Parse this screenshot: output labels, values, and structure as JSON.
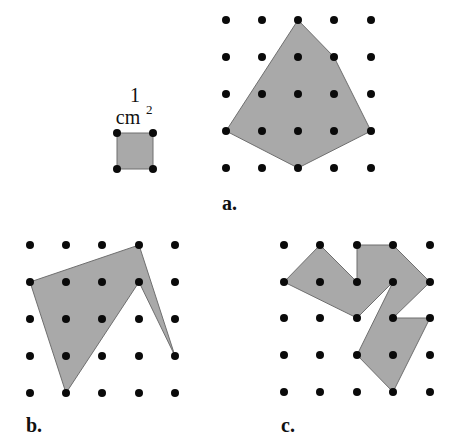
{
  "figure": {
    "colors": {
      "dot": "#0a0a0a",
      "fill": "#a9a9a9",
      "stroke": "#6f6f6f"
    },
    "unit_square": {
      "label_number": "1",
      "label_unit": "cm",
      "label_exponent": "2",
      "corners_px": [
        [
          117,
          133
        ],
        [
          153,
          133
        ],
        [
          153,
          169
        ],
        [
          117,
          169
        ]
      ]
    },
    "panels": [
      {
        "id": "a",
        "label": "a.",
        "label_pos": [
          222,
          210
        ],
        "grid_x": [
          226,
          262,
          298,
          334,
          371
        ],
        "grid_y": [
          20,
          57,
          94,
          131,
          168
        ],
        "polygon_grid": [
          [
            2,
            0
          ],
          [
            3,
            1
          ],
          [
            4,
            3
          ],
          [
            2,
            4
          ],
          [
            0,
            3
          ]
        ]
      },
      {
        "id": "b",
        "label": "b.",
        "label_pos": [
          26,
          432
        ],
        "grid_x": [
          30,
          66,
          102,
          139,
          175
        ],
        "grid_y": [
          245,
          282,
          319,
          356,
          393
        ],
        "polygon_grid": [
          [
            0,
            1
          ],
          [
            3,
            0
          ],
          [
            4,
            3
          ],
          [
            3,
            1
          ],
          [
            1,
            4
          ]
        ]
      },
      {
        "id": "c",
        "label": "c.",
        "label_pos": [
          281,
          432
        ],
        "grid_x": [
          284,
          320,
          357,
          393,
          430
        ],
        "grid_y": [
          245,
          282,
          318,
          355,
          392
        ],
        "polygon_grid": [
          [
            0,
            1
          ],
          [
            1,
            0
          ],
          [
            2,
            1
          ],
          [
            2,
            0
          ],
          [
            3,
            0
          ],
          [
            4,
            1
          ],
          [
            3,
            2
          ],
          [
            4,
            2
          ],
          [
            3,
            4
          ],
          [
            2,
            3
          ],
          [
            3,
            1
          ],
          [
            2,
            2
          ]
        ]
      }
    ]
  }
}
